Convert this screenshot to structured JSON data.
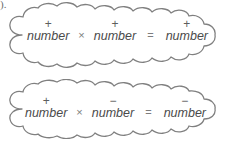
{
  "page": {
    "fragment_text": ").",
    "background_color": "#ffffff",
    "outline_color": "#808080",
    "text_color": "#4a4a4a"
  },
  "rules": [
    {
      "id": "rule-positive-times-positive",
      "terms": [
        {
          "sign": "+",
          "label": "number"
        },
        {
          "sign": "+",
          "label": "number"
        },
        {
          "sign": "+",
          "label": "number"
        }
      ],
      "operators": {
        "multiply": "×",
        "equals": "="
      }
    },
    {
      "id": "rule-positive-times-negative",
      "terms": [
        {
          "sign": "+",
          "label": "number"
        },
        {
          "sign": "−",
          "label": "number"
        },
        {
          "sign": "−",
          "label": "number"
        }
      ],
      "operators": {
        "multiply": "×",
        "equals": "="
      }
    }
  ]
}
